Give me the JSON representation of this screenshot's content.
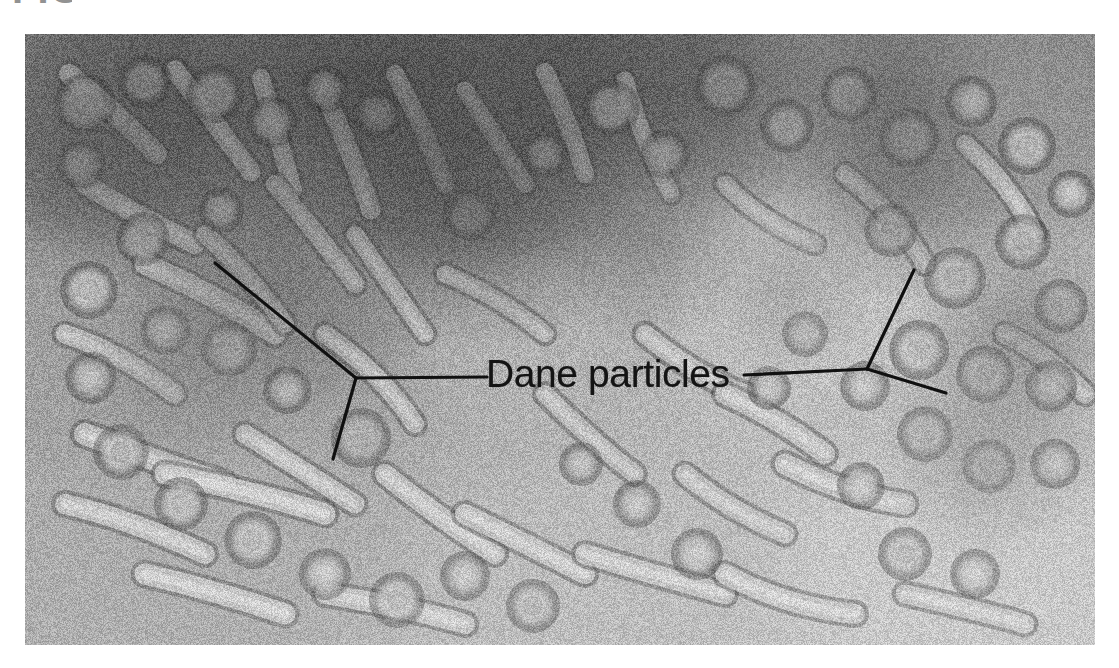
{
  "figure": {
    "kind": "electron-micrograph",
    "caption_remnant": "FIG",
    "plate": {
      "left": 25,
      "top": 34,
      "width": 1070,
      "height": 611,
      "background_color": "#a9a9a9",
      "border_color": "#ffffff"
    }
  },
  "annotations": {
    "label": {
      "text": "Dane particles",
      "x": 486,
      "y": 352,
      "font_size": 39,
      "color": "#141414"
    },
    "leaders": [
      {
        "name": "left-leader",
        "color": "#101010",
        "width": 3.2,
        "junction": {
          "x": 356,
          "y": 378
        },
        "stem_to": {
          "x": 487,
          "y": 377
        },
        "branches": [
          {
            "name": "left-leader-upper-branch",
            "x": 215,
            "y": 263
          },
          {
            "name": "left-leader-lower-branch",
            "x": 333,
            "y": 459
          }
        ]
      },
      {
        "name": "right-leader",
        "color": "#101010",
        "width": 3.2,
        "junction": {
          "x": 867,
          "y": 369
        },
        "stem_to": {
          "x": 744,
          "y": 375
        },
        "branches": [
          {
            "name": "right-leader-upper-branch",
            "x": 914,
            "y": 270
          },
          {
            "name": "right-leader-lower-branch",
            "x": 946,
            "y": 393
          }
        ]
      }
    ]
  },
  "chart_data": {
    "type": "heatmap",
    "note": "Grayscale field; dark regions = heavy negative stain, light regions = virion surfaces",
    "background_gradient": [
      {
        "region": "upper-left",
        "tone": 118
      },
      {
        "region": "upper-center",
        "tone": 104
      },
      {
        "region": "upper-right",
        "tone": 150
      },
      {
        "region": "center",
        "tone": 176
      },
      {
        "region": "lower-left",
        "tone": 166
      },
      {
        "region": "lower-right",
        "tone": 196
      }
    ],
    "particles": {
      "spheres": [
        {
          "x": 60,
          "y": 70,
          "r": 26,
          "tone": 205
        },
        {
          "x": 120,
          "y": 48,
          "r": 22,
          "tone": 200
        },
        {
          "x": 56,
          "y": 130,
          "r": 20,
          "tone": 198
        },
        {
          "x": 190,
          "y": 60,
          "r": 24,
          "tone": 206
        },
        {
          "x": 247,
          "y": 88,
          "r": 21,
          "tone": 198
        },
        {
          "x": 300,
          "y": 55,
          "r": 19,
          "tone": 196
        },
        {
          "x": 352,
          "y": 80,
          "r": 20,
          "tone": 200
        },
        {
          "x": 196,
          "y": 176,
          "r": 18,
          "tone": 196
        },
        {
          "x": 118,
          "y": 205,
          "r": 22,
          "tone": 202
        },
        {
          "x": 64,
          "y": 256,
          "r": 24,
          "tone": 206
        },
        {
          "x": 140,
          "y": 296,
          "r": 20,
          "tone": 198
        },
        {
          "x": 66,
          "y": 344,
          "r": 21,
          "tone": 200
        },
        {
          "x": 204,
          "y": 315,
          "r": 23,
          "tone": 208
        },
        {
          "x": 262,
          "y": 356,
          "r": 19,
          "tone": 196
        },
        {
          "x": 336,
          "y": 404,
          "r": 25,
          "tone": 190
        },
        {
          "x": 96,
          "y": 418,
          "r": 23,
          "tone": 204
        },
        {
          "x": 156,
          "y": 470,
          "r": 22,
          "tone": 206
        },
        {
          "x": 228,
          "y": 506,
          "r": 24,
          "tone": 208
        },
        {
          "x": 300,
          "y": 540,
          "r": 21,
          "tone": 202
        },
        {
          "x": 372,
          "y": 566,
          "r": 23,
          "tone": 206
        },
        {
          "x": 440,
          "y": 542,
          "r": 20,
          "tone": 200
        },
        {
          "x": 508,
          "y": 572,
          "r": 22,
          "tone": 204
        },
        {
          "x": 445,
          "y": 180,
          "r": 22,
          "tone": 182
        },
        {
          "x": 520,
          "y": 120,
          "r": 19,
          "tone": 186
        },
        {
          "x": 586,
          "y": 74,
          "r": 24,
          "tone": 198
        },
        {
          "x": 640,
          "y": 120,
          "r": 20,
          "tone": 190
        },
        {
          "x": 700,
          "y": 52,
          "r": 26,
          "tone": 206
        },
        {
          "x": 762,
          "y": 92,
          "r": 22,
          "tone": 198
        },
        {
          "x": 824,
          "y": 60,
          "r": 23,
          "tone": 200
        },
        {
          "x": 884,
          "y": 104,
          "r": 25,
          "tone": 210
        },
        {
          "x": 946,
          "y": 68,
          "r": 21,
          "tone": 200
        },
        {
          "x": 1002,
          "y": 112,
          "r": 24,
          "tone": 208
        },
        {
          "x": 866,
          "y": 196,
          "r": 22,
          "tone": 202
        },
        {
          "x": 930,
          "y": 244,
          "r": 26,
          "tone": 212
        },
        {
          "x": 998,
          "y": 208,
          "r": 23,
          "tone": 206
        },
        {
          "x": 1036,
          "y": 272,
          "r": 22,
          "tone": 208
        },
        {
          "x": 894,
          "y": 316,
          "r": 25,
          "tone": 210
        },
        {
          "x": 960,
          "y": 340,
          "r": 24,
          "tone": 212
        },
        {
          "x": 1026,
          "y": 352,
          "r": 21,
          "tone": 206
        },
        {
          "x": 840,
          "y": 352,
          "r": 20,
          "tone": 200
        },
        {
          "x": 780,
          "y": 300,
          "r": 18,
          "tone": 198
        },
        {
          "x": 744,
          "y": 354,
          "r": 17,
          "tone": 196
        },
        {
          "x": 900,
          "y": 400,
          "r": 23,
          "tone": 208
        },
        {
          "x": 964,
          "y": 432,
          "r": 22,
          "tone": 210
        },
        {
          "x": 1030,
          "y": 430,
          "r": 20,
          "tone": 206
        },
        {
          "x": 836,
          "y": 452,
          "r": 19,
          "tone": 202
        },
        {
          "x": 880,
          "y": 520,
          "r": 22,
          "tone": 208
        },
        {
          "x": 950,
          "y": 540,
          "r": 20,
          "tone": 206
        },
        {
          "x": 612,
          "y": 470,
          "r": 19,
          "tone": 198
        },
        {
          "x": 672,
          "y": 520,
          "r": 21,
          "tone": 202
        },
        {
          "x": 556,
          "y": 430,
          "r": 17,
          "tone": 194
        },
        {
          "x": 1046,
          "y": 160,
          "r": 19,
          "tone": 202
        }
      ],
      "filaments": [
        {
          "x1": 44,
          "y1": 40,
          "x2": 132,
          "y2": 120,
          "w": 20,
          "tone": 196
        },
        {
          "x1": 150,
          "y1": 36,
          "x2": 226,
          "y2": 138,
          "w": 19,
          "tone": 198
        },
        {
          "x1": 236,
          "y1": 44,
          "x2": 268,
          "y2": 156,
          "w": 18,
          "tone": 194
        },
        {
          "x1": 300,
          "y1": 60,
          "x2": 346,
          "y2": 176,
          "w": 19,
          "tone": 196
        },
        {
          "x1": 370,
          "y1": 40,
          "x2": 420,
          "y2": 150,
          "w": 18,
          "tone": 192
        },
        {
          "x1": 440,
          "y1": 56,
          "x2": 500,
          "y2": 150,
          "w": 17,
          "tone": 186
        },
        {
          "x1": 520,
          "y1": 38,
          "x2": 560,
          "y2": 140,
          "w": 18,
          "tone": 188
        },
        {
          "x1": 600,
          "y1": 46,
          "x2": 646,
          "y2": 160,
          "w": 17,
          "tone": 190
        },
        {
          "x1": 60,
          "y1": 150,
          "x2": 170,
          "y2": 210,
          "w": 20,
          "tone": 198
        },
        {
          "x1": 120,
          "y1": 230,
          "x2": 250,
          "y2": 300,
          "w": 21,
          "tone": 200
        },
        {
          "x1": 40,
          "y1": 300,
          "x2": 150,
          "y2": 360,
          "w": 19,
          "tone": 198
        },
        {
          "x1": 180,
          "y1": 200,
          "x2": 260,
          "y2": 290,
          "w": 18,
          "tone": 192
        },
        {
          "x1": 250,
          "y1": 150,
          "x2": 330,
          "y2": 250,
          "w": 18,
          "tone": 190
        },
        {
          "x1": 330,
          "y1": 200,
          "x2": 400,
          "y2": 300,
          "w": 17,
          "tone": 188
        },
        {
          "x1": 60,
          "y1": 400,
          "x2": 200,
          "y2": 450,
          "w": 22,
          "tone": 204
        },
        {
          "x1": 140,
          "y1": 440,
          "x2": 300,
          "y2": 480,
          "w": 21,
          "tone": 206
        },
        {
          "x1": 40,
          "y1": 470,
          "x2": 180,
          "y2": 520,
          "w": 20,
          "tone": 202
        },
        {
          "x1": 220,
          "y1": 400,
          "x2": 330,
          "y2": 470,
          "w": 19,
          "tone": 200
        },
        {
          "x1": 300,
          "y1": 300,
          "x2": 390,
          "y2": 390,
          "w": 18,
          "tone": 194
        },
        {
          "x1": 360,
          "y1": 440,
          "x2": 470,
          "y2": 520,
          "w": 20,
          "tone": 202
        },
        {
          "x1": 440,
          "y1": 480,
          "x2": 560,
          "y2": 540,
          "w": 20,
          "tone": 204
        },
        {
          "x1": 520,
          "y1": 360,
          "x2": 610,
          "y2": 440,
          "w": 18,
          "tone": 196
        },
        {
          "x1": 620,
          "y1": 300,
          "x2": 720,
          "y2": 360,
          "w": 19,
          "tone": 198
        },
        {
          "x1": 700,
          "y1": 360,
          "x2": 800,
          "y2": 420,
          "w": 20,
          "tone": 202
        },
        {
          "x1": 760,
          "y1": 430,
          "x2": 880,
          "y2": 470,
          "w": 21,
          "tone": 204
        },
        {
          "x1": 660,
          "y1": 440,
          "x2": 760,
          "y2": 500,
          "w": 19,
          "tone": 200
        },
        {
          "x1": 560,
          "y1": 520,
          "x2": 700,
          "y2": 560,
          "w": 20,
          "tone": 204
        },
        {
          "x1": 820,
          "y1": 140,
          "x2": 900,
          "y2": 230,
          "w": 18,
          "tone": 196
        },
        {
          "x1": 940,
          "y1": 110,
          "x2": 1010,
          "y2": 200,
          "w": 18,
          "tone": 198
        },
        {
          "x1": 980,
          "y1": 300,
          "x2": 1060,
          "y2": 360,
          "w": 19,
          "tone": 204
        },
        {
          "x1": 700,
          "y1": 150,
          "x2": 790,
          "y2": 210,
          "w": 17,
          "tone": 192
        },
        {
          "x1": 420,
          "y1": 240,
          "x2": 520,
          "y2": 300,
          "w": 17,
          "tone": 190
        },
        {
          "x1": 120,
          "y1": 540,
          "x2": 260,
          "y2": 580,
          "w": 21,
          "tone": 206
        },
        {
          "x1": 300,
          "y1": 560,
          "x2": 440,
          "y2": 590,
          "w": 20,
          "tone": 204
        },
        {
          "x1": 700,
          "y1": 540,
          "x2": 830,
          "y2": 580,
          "w": 20,
          "tone": 206
        },
        {
          "x1": 880,
          "y1": 560,
          "x2": 1000,
          "y2": 590,
          "w": 19,
          "tone": 204
        }
      ]
    }
  }
}
